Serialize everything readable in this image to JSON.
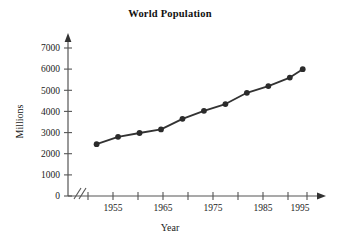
{
  "chart_data": {
    "type": "line",
    "title": "World Population",
    "xlabel": "Year",
    "ylabel": "Millions",
    "grid": false,
    "legend": null,
    "xlim": [
      1950,
      2001
    ],
    "ylim": [
      0,
      7000
    ],
    "x_axis_break": true,
    "x_axis_break_symbol": "//",
    "x_tick_values": [
      1950,
      1955,
      1960,
      1965,
      1970,
      1975,
      1980,
      1985,
      1990,
      1995,
      2000
    ],
    "x_tick_labels": [
      "",
      "1955",
      "",
      "1965",
      "",
      "1975",
      "",
      "1985",
      "",
      "1995",
      ""
    ],
    "y_tick_values": [
      0,
      1000,
      2000,
      3000,
      4000,
      5000,
      6000,
      7000
    ],
    "y_tick_labels": [
      "0",
      "1000",
      "2000",
      "3000",
      "4000",
      "5000",
      "6000",
      "7000"
    ],
    "series": [
      {
        "name": "World Population",
        "marker": "filled-circle",
        "color": "#333333",
        "x": [
          1952,
          1957,
          1962,
          1967,
          1972,
          1977,
          1982,
          1987,
          1992,
          1997,
          2000
        ],
        "values": [
          2450,
          2800,
          2980,
          3150,
          3650,
          4030,
          4350,
          4880,
          5200,
          5600,
          6000
        ]
      }
    ]
  },
  "axis": {
    "x_label": "Year",
    "y_label": "Millions"
  },
  "colors": {
    "line": "#333333",
    "marker": "#2b2b2b",
    "axis": "#555555",
    "text": "#1a1a1a"
  }
}
